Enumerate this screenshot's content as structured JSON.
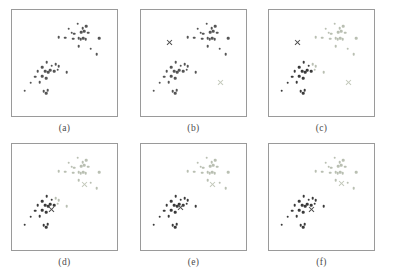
{
  "figure": {
    "panel_count": 6,
    "rows": 2,
    "columns": 3,
    "background_color": "#ffffff",
    "frame_color": "#9a9a9a"
  },
  "colors": {
    "unassigned_point": "#555555",
    "cluster_a_point": "#3a3a3a",
    "cluster_b_point": "#b9bfb2",
    "centroid_a": "#4a4a4a",
    "centroid_b": "#c2c8ba",
    "caption_text": "#4a4a4a"
  },
  "panels": [
    {
      "id": "a",
      "caption": "(a)",
      "description": "original unlabeled data points",
      "centroids": []
    },
    {
      "id": "b",
      "caption": "(b)",
      "description": "initial random centroids placed",
      "centroids": [
        {
          "cluster": "a",
          "x": 27,
          "y": 31
        },
        {
          "cluster": "b",
          "x": 76,
          "y": 68
        }
      ]
    },
    {
      "id": "c",
      "caption": "(c)",
      "description": "points assigned to nearest centroid",
      "centroids": [
        {
          "cluster": "a",
          "x": 27,
          "y": 31
        },
        {
          "cluster": "b",
          "x": 76,
          "y": 68
        }
      ]
    },
    {
      "id": "d",
      "caption": "(d)",
      "description": "centroids recomputed from assignments",
      "centroids": [
        {
          "cluster": "a",
          "x": 38,
          "y": 62
        },
        {
          "cluster": "b",
          "x": 69,
          "y": 38
        }
      ]
    },
    {
      "id": "e",
      "caption": "(e)",
      "description": "points reassigned to updated centroids",
      "centroids": [
        {
          "cluster": "a",
          "x": 38,
          "y": 60
        },
        {
          "cluster": "b",
          "x": 68,
          "y": 38
        }
      ]
    },
    {
      "id": "f",
      "caption": "(f)",
      "description": "converged clustering result",
      "centroids": [
        {
          "cluster": "a",
          "x": 40,
          "y": 62
        },
        {
          "cluster": "b",
          "x": 69,
          "y": 37
        }
      ]
    }
  ],
  "chart_data": {
    "type": "scatter",
    "xlabel": "",
    "ylabel": "",
    "xlim": [
      0,
      100
    ],
    "ylim": [
      0,
      100
    ],
    "grid": false,
    "legend": null,
    "note": "Coordinates are percentages of each panel box; y increases downward.",
    "points": [
      {
        "x": 62.5,
        "y": 13.0,
        "cluster": "b"
      },
      {
        "x": 54.0,
        "y": 17.5,
        "cluster": "b"
      },
      {
        "x": 67.5,
        "y": 17.0,
        "cluster": "b"
      },
      {
        "x": 70.5,
        "y": 15.5,
        "cluster": "b"
      },
      {
        "x": 57.0,
        "y": 21.5,
        "cluster": "b"
      },
      {
        "x": 59.0,
        "y": 22.5,
        "cluster": "b"
      },
      {
        "x": 66.0,
        "y": 21.0,
        "cluster": "b"
      },
      {
        "x": 69.0,
        "y": 20.0,
        "cluster": "b"
      },
      {
        "x": 72.5,
        "y": 21.5,
        "cluster": "b"
      },
      {
        "x": 44.5,
        "y": 25.5,
        "cluster": "b"
      },
      {
        "x": 50.5,
        "y": 26.0,
        "cluster": "b"
      },
      {
        "x": 58.5,
        "y": 27.0,
        "cluster": "b"
      },
      {
        "x": 63.5,
        "y": 26.5,
        "cluster": "b"
      },
      {
        "x": 65.5,
        "y": 27.5,
        "cluster": "b"
      },
      {
        "x": 68.0,
        "y": 26.5,
        "cluster": "b"
      },
      {
        "x": 70.0,
        "y": 27.5,
        "cluster": "b"
      },
      {
        "x": 83.0,
        "y": 26.5,
        "cluster": "b"
      },
      {
        "x": 75.0,
        "y": 36.5,
        "cluster": "b"
      },
      {
        "x": 80.5,
        "y": 41.5,
        "cluster": "b"
      },
      {
        "x": 63.5,
        "y": 34.0,
        "cluster": "b"
      },
      {
        "x": 33.0,
        "y": 49.0,
        "cluster": "a"
      },
      {
        "x": 28.5,
        "y": 54.0,
        "cluster": "a"
      },
      {
        "x": 38.0,
        "y": 52.5,
        "cluster": "a"
      },
      {
        "x": 41.5,
        "y": 51.0,
        "cluster": "a"
      },
      {
        "x": 44.5,
        "y": 53.0,
        "cluster": "a"
      },
      {
        "x": 24.5,
        "y": 58.0,
        "cluster": "a"
      },
      {
        "x": 31.5,
        "y": 57.5,
        "cluster": "a"
      },
      {
        "x": 34.5,
        "y": 58.5,
        "cluster": "a"
      },
      {
        "x": 36.5,
        "y": 57.0,
        "cluster": "a"
      },
      {
        "x": 40.0,
        "y": 57.5,
        "cluster": "a"
      },
      {
        "x": 43.5,
        "y": 56.5,
        "cluster": "a"
      },
      {
        "x": 52.0,
        "y": 58.5,
        "cluster": "a"
      },
      {
        "x": 22.0,
        "y": 63.0,
        "cluster": "a"
      },
      {
        "x": 29.0,
        "y": 62.5,
        "cluster": "a"
      },
      {
        "x": 32.5,
        "y": 64.5,
        "cluster": "a"
      },
      {
        "x": 18.0,
        "y": 68.5,
        "cluster": "a"
      },
      {
        "x": 26.5,
        "y": 68.0,
        "cluster": "a"
      },
      {
        "x": 12.0,
        "y": 76.0,
        "cluster": "a"
      },
      {
        "x": 30.0,
        "y": 76.5,
        "cluster": "a"
      },
      {
        "x": 32.5,
        "y": 78.5,
        "cluster": "a"
      },
      {
        "x": 34.0,
        "y": 75.5,
        "cluster": "a"
      }
    ]
  }
}
